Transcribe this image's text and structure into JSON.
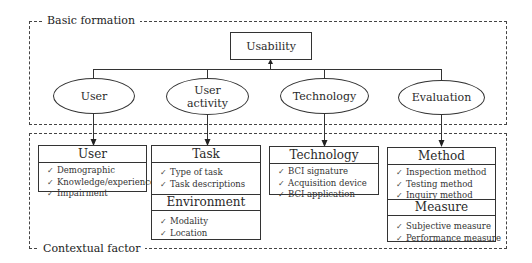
{
  "groups": {
    "basic": {
      "label": "Basic formation"
    },
    "contextual": {
      "label": "Contextual factor"
    }
  },
  "root": {
    "label": "Usability"
  },
  "nodes": [
    {
      "id": "user",
      "label": "User"
    },
    {
      "id": "user-activity",
      "label_line1": "User",
      "label_line2": "activity"
    },
    {
      "id": "technology",
      "label": "Technology"
    },
    {
      "id": "evaluation",
      "label": "Evaluation"
    }
  ],
  "cards": {
    "user": {
      "title": "User",
      "items": [
        "Demographic",
        "Knowledge/experience",
        "Impairment"
      ]
    },
    "task": {
      "title": "Task",
      "items": [
        "Type of task",
        "Task descriptions"
      ],
      "sub_title": "Environment",
      "sub_items": [
        "Modality",
        "Location"
      ]
    },
    "technology": {
      "title": "Technology",
      "items": [
        "BCI signature",
        "Acquisition device",
        "BCI application"
      ]
    },
    "method": {
      "title": "Method",
      "items": [
        "Inspection method",
        "Testing method",
        "Inquiry method"
      ],
      "sub_title": "Measure",
      "sub_items": [
        "Subjective measure",
        "Performance measure"
      ]
    }
  },
  "check_glyph": "✓"
}
